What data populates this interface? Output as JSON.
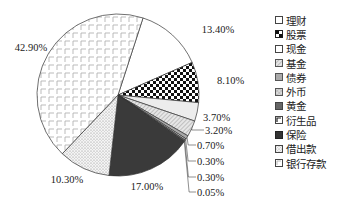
{
  "chart_data": {
    "type": "pie",
    "title": "",
    "start_angle_deg_clockwise_from_top": 18,
    "direction": "clockwise",
    "categories": [
      "理财",
      "股票",
      "现金",
      "基金",
      "债券",
      "外币",
      "黄金",
      "衍生品",
      "保险",
      "借出款",
      "银行存款"
    ],
    "values": [
      13.4,
      8.1,
      3.7,
      3.2,
      0.7,
      0.3,
      0.3,
      0.05,
      17.0,
      10.3,
      42.9
    ],
    "labels": [
      "13.40%",
      "8.10%",
      "3.70%",
      "3.20%",
      "0.70%",
      "0.30%",
      "0.30%",
      "0.05%",
      "17.00%",
      "10.30%",
      "42.90%"
    ],
    "legend_position": "right",
    "patterns": [
      "white",
      "checker",
      "light-gray",
      "hatch-diagonal",
      "mid-gray",
      "cross-hatch",
      "dark-gray",
      "corner-mark",
      "black",
      "dotted",
      "grid-corner"
    ]
  },
  "legend": {
    "items": [
      {
        "label": "理财",
        "swatch": "white"
      },
      {
        "label": "股票",
        "swatch": "checker"
      },
      {
        "label": "现金",
        "swatch": "white"
      },
      {
        "label": "基金",
        "swatch": "hatch-diagonal"
      },
      {
        "label": "债券",
        "swatch": "mid-gray"
      },
      {
        "label": "外币",
        "swatch": "cross-hatch"
      },
      {
        "label": "黄金",
        "swatch": "dark-gray"
      },
      {
        "label": "衍生品",
        "swatch": "corner-mark"
      },
      {
        "label": "保险",
        "swatch": "black"
      },
      {
        "label": "借出款",
        "swatch": "dotted"
      },
      {
        "label": "银行存款",
        "swatch": "grid-corner"
      }
    ]
  }
}
